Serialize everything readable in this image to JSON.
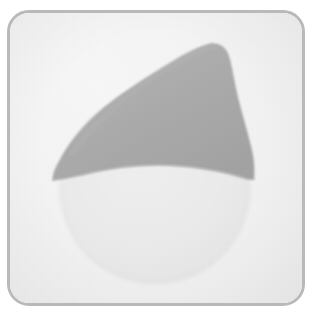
{
  "image": {
    "kind": "specimen-thumbnail",
    "width": 315,
    "height": 319,
    "has_visible_text": false,
    "background_color": "#ffffff"
  },
  "card": {
    "name": "rounded-rectangle-frame",
    "border_color": "#b9b9b9",
    "border_width": 3,
    "corner_radius": 22,
    "fill_color": "#f3f3f3",
    "left": 7,
    "top": 10,
    "width": 298,
    "height": 296
  },
  "plate": {
    "name": "plate-surface",
    "fill_color": "#f2f2f2",
    "grain": "fine-paper-texture"
  },
  "shapes": {
    "circle": {
      "name": "pale-circle",
      "fill_color": "#e9e9e9",
      "stroke_color": "#e0e0e0",
      "center_x": 152,
      "center_y": 186,
      "radius": 95
    },
    "cap": {
      "name": "gray-cap",
      "fill_color": "#adadad",
      "edge_shadow_color": "#9d9d9d",
      "description": "hood-shaped gray region with pointed apex upper-right, tapering left point, concave lower arc",
      "apex_x": 215,
      "apex_y": 41,
      "left_point_x": 49,
      "left_point_y": 166,
      "right_point_x": 250,
      "right_point_y": 176,
      "arc_low_x": 155,
      "arc_low_y": 163
    }
  },
  "palette": {
    "white": "#ffffff",
    "plate_light": "#f4f4f4",
    "circle_gray": "#e9e9e9",
    "cap_gray": "#adadad",
    "border_gray": "#b9b9b9",
    "shadow_gray": "#9d9d9d"
  }
}
